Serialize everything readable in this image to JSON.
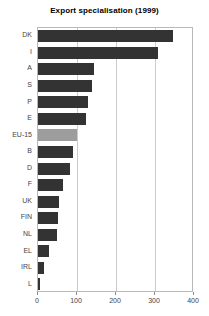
{
  "chart_data": {
    "type": "bar",
    "orientation": "horizontal",
    "title": "Export specialisation (1999)",
    "subtitle": "",
    "xlabel": "",
    "ylabel": "",
    "xlim": [
      0,
      400
    ],
    "xticks": [
      0,
      100,
      200,
      300,
      400
    ],
    "grid": "vertical",
    "legend": "none",
    "highlight_category": "EU-15",
    "colors": {
      "bar": "#333333",
      "highlight_bar": "#9d9d9d",
      "grid": "#cccccc",
      "axis": "#b9b9b9",
      "text": "#444444",
      "title": "#000000",
      "background": "#ffffff"
    },
    "categories": [
      "DK",
      "I",
      "A",
      "S",
      "P",
      "E",
      "EU-15",
      "B",
      "D",
      "F",
      "UK",
      "FIN",
      "NL",
      "EL",
      "IRL",
      "L"
    ],
    "values": [
      346,
      308,
      144,
      138,
      128,
      123,
      100,
      90,
      82,
      64,
      54,
      51,
      49,
      28,
      16,
      6
    ]
  }
}
